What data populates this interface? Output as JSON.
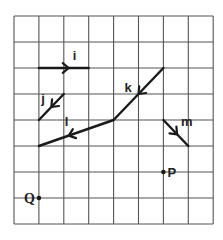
{
  "grid": {
    "columns": 8,
    "rows": 8,
    "origin_x": 14,
    "origin_y": 16,
    "cell_w": 24.9,
    "cell_h": 26,
    "line_color": "#555555",
    "stroke_color": "#1a1a1a"
  },
  "vectors": [
    {
      "label": "i",
      "from": [
        1,
        2
      ],
      "to": [
        3,
        2
      ],
      "arrow_at": 0.6,
      "arrow_dir": "forward",
      "label_offset": [
        4,
        -8
      ]
    },
    {
      "label": "j",
      "from": [
        2,
        3
      ],
      "to": [
        1,
        4
      ],
      "arrow_at": 0.5,
      "arrow_dir": "forward",
      "label_offset": [
        -10,
        -4
      ]
    },
    {
      "label": "k",
      "from": [
        6,
        2
      ],
      "to": [
        4,
        4
      ],
      "arrow_at": 0.5,
      "arrow_dir": "forward",
      "label_offset": [
        -14,
        -2
      ]
    },
    {
      "label": "l",
      "from": [
        4,
        4
      ],
      "to": [
        1,
        5
      ],
      "arrow_at": 0.6,
      "arrow_dir": "forward",
      "label_offset": [
        -4,
        -10
      ]
    },
    {
      "label": "m",
      "from": [
        6,
        4
      ],
      "to": [
        7,
        5
      ],
      "arrow_at": 0.55,
      "arrow_dir": "forward",
      "label_offset": [
        4,
        -8
      ]
    }
  ],
  "points": [
    {
      "label": "P",
      "at": [
        6,
        6
      ],
      "label_side": "right"
    },
    {
      "label": "Q",
      "at": [
        1,
        7
      ],
      "label_side": "left"
    }
  ]
}
